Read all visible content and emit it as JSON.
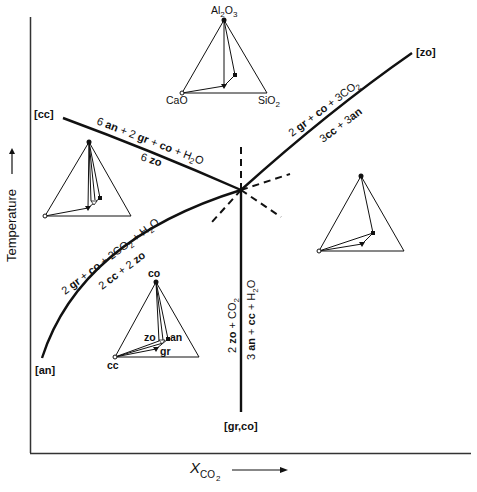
{
  "axes": {
    "y_label": "Temperature",
    "y_arrow": "→",
    "x_label_main": "X",
    "x_label_sub": "CO",
    "x_label_subsub": "2",
    "x_arrow": "→"
  },
  "invariant_point": {
    "x": 241,
    "y": 190
  },
  "invariant_point_labels": {
    "cc": "[cc]",
    "zo": "[zo]",
    "an": "[an]",
    "gr_co": "[gr,co]"
  },
  "reactions": [
    {
      "id": "cc",
      "absent_phase": "[cc]",
      "upper_side": "6 an + 2 gr + co + H2O",
      "lower_side": "6 zo"
    },
    {
      "id": "zo",
      "absent_phase": "[zo]",
      "upper_side": "2 gr + co + 3CO2",
      "lower_side": "3cc + 3an"
    },
    {
      "id": "an",
      "absent_phase": "[an]",
      "upper_side": "2 gr + co + 2CO2 + H2O",
      "lower_side": "2 cc + 2 zo"
    },
    {
      "id": "gr_co",
      "absent_phase": "[gr,co]",
      "left_side": "2 zo + CO2",
      "right_side": "3 an + cc + H2O"
    }
  ],
  "reaction_text": {
    "cc_upper_a": "6 ",
    "cc_upper_an": "an",
    "cc_upper_b": " + 2 ",
    "cc_upper_gr": "gr",
    "cc_upper_c": " + ",
    "cc_upper_co": "co",
    "cc_upper_d": " + H",
    "cc_upper_sub": "2",
    "cc_upper_e": "O",
    "cc_lower_a": "6 ",
    "cc_lower_zo": "zo",
    "zo_upper_a": "2 ",
    "zo_upper_gr": "gr",
    "zo_upper_b": " + ",
    "zo_upper_co": "co",
    "zo_upper_c": " + 3CO",
    "zo_upper_sub": "2",
    "zo_lower_a": "3",
    "zo_lower_cc": "cc",
    "zo_lower_b": " + 3",
    "zo_lower_an": "an",
    "an_upper_a": "2 ",
    "an_upper_gr": "gr",
    "an_upper_b": " + ",
    "an_upper_co": "co",
    "an_upper_c": " + 2CO",
    "an_upper_sub": "2",
    "an_upper_d": " + H",
    "an_upper_sub2": "2",
    "an_upper_e": "O",
    "an_lower_a": "2 ",
    "an_lower_cc": "cc",
    "an_lower_b": " + 2 ",
    "an_lower_zo": "zo",
    "grco_left_a": "2 ",
    "grco_left_zo": "zo",
    "grco_left_b": " + CO",
    "grco_left_sub": "2",
    "grco_right_a": "3 ",
    "grco_right_an": "an",
    "grco_right_b": " + ",
    "grco_right_cc": "cc",
    "grco_right_c": " + H",
    "grco_right_sub": "2",
    "grco_right_d": "O"
  },
  "composition_triangles": {
    "top": {
      "apex_label_main": "Al",
      "apex_label_sub1": "2",
      "apex_label_mid": "O",
      "apex_label_sub2": "3",
      "left_label": "CaO",
      "right_label_main": "SiO",
      "right_label_sub": "2"
    },
    "lower_left": {
      "apex_label": "co",
      "left_label": "cc",
      "zo_label": "zo",
      "an_label": "an",
      "gr_label": "gr"
    }
  },
  "colors": {
    "ink": "#111111",
    "background": "#ffffff",
    "axis": "#333333"
  }
}
